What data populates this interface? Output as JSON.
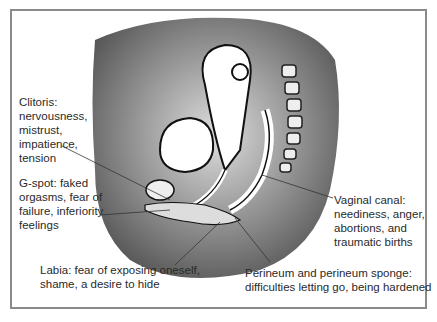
{
  "diagram": {
    "type": "anatomical cross-section illustration",
    "labels": [
      {
        "id": "clitoris",
        "text": "Clitoris:\nnervousness,\nmistrust,\nimpatience,\ntension"
      },
      {
        "id": "g_spot",
        "text": "G-spot: faked\norgasms, fear of\nfailure, inferiority\nfeelings"
      },
      {
        "id": "labia",
        "text": "Labia: fear of exposing oneself,\nshame, a desire to hide"
      },
      {
        "id": "perineum",
        "text": "Perineum and perineum sponge:\ndifficulties letting go, being hardened"
      },
      {
        "id": "vaginal_canal",
        "text": "Vaginal canal:\nneediness, anger,\nabortions, and\ntraumatic births"
      }
    ]
  }
}
